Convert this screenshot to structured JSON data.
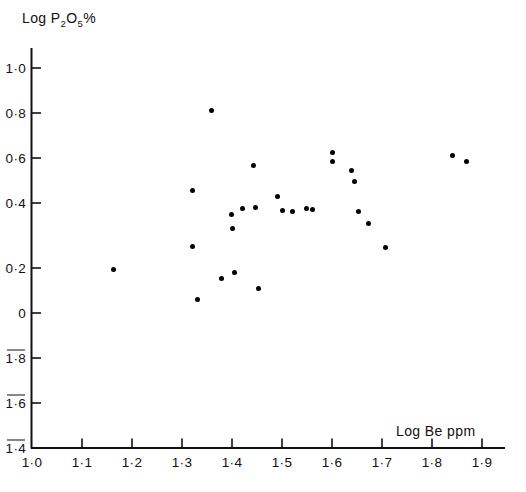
{
  "chart_data": {
    "type": "scatter",
    "title": "",
    "xlabel": "Log  Be ppm",
    "ylabel": "Log P2O5%",
    "ylabel_parts": {
      "prefix": "Log P",
      "sub1": "2",
      "mid": "O",
      "sub2": "5",
      "suffix": "%"
    },
    "xlim": [
      1.0,
      1.95
    ],
    "ylim": [
      -1.4,
      1.05
    ],
    "grid": false,
    "legend": null,
    "xticks": [
      1.0,
      1.1,
      1.2,
      1.3,
      1.4,
      1.5,
      1.6,
      1.7,
      1.8,
      1.9
    ],
    "xtick_labels": [
      "1·0",
      "1·1",
      "1·2",
      "1·3",
      "1·4",
      "1·5",
      "1·6",
      "1·7",
      "1·8",
      "1·9"
    ],
    "yticks": [
      1.0,
      0.8,
      0.6,
      0.4,
      0.2,
      0.0,
      -1.8,
      -1.6,
      -1.4
    ],
    "ytick_labels": [
      "1·0",
      "0·8",
      "0·6",
      "0·4",
      "0·2",
      "0",
      "1·8",
      "1·6",
      "1·4"
    ],
    "ytick_overline": [
      false,
      false,
      false,
      false,
      false,
      false,
      true,
      true,
      true
    ],
    "ytick_overline_note": "Negative values are written with a bar over the leading digit (bar-notation logarithms)",
    "marker": "filled-circle",
    "marker_color": "#000000",
    "marker_size_px": 5,
    "n_points": 33,
    "points": [
      {
        "x": 1.13,
        "y": -1.755
      },
      {
        "x": 1.162,
        "y": 0.195
      },
      {
        "x": 1.32,
        "y": 0.545
      },
      {
        "x": 1.32,
        "y": 0.295
      },
      {
        "x": 1.33,
        "y": 0.06
      },
      {
        "x": 1.358,
        "y": 0.9
      },
      {
        "x": 1.378,
        "y": 0.155
      },
      {
        "x": 1.398,
        "y": 0.44
      },
      {
        "x": 1.4,
        "y": 0.375
      },
      {
        "x": 1.404,
        "y": 0.18
      },
      {
        "x": 1.42,
        "y": 0.465
      },
      {
        "x": 1.442,
        "y": 0.655
      },
      {
        "x": 1.446,
        "y": 0.47
      },
      {
        "x": 1.452,
        "y": 0.11
      },
      {
        "x": 1.49,
        "y": 0.52
      },
      {
        "x": 1.5,
        "y": 0.455
      },
      {
        "x": 1.52,
        "y": 0.45
      },
      {
        "x": 1.548,
        "y": 0.465
      },
      {
        "x": 1.56,
        "y": 0.46
      },
      {
        "x": 1.6,
        "y": 0.715
      },
      {
        "x": 1.6,
        "y": 0.675
      },
      {
        "x": 1.638,
        "y": 0.635
      },
      {
        "x": 1.645,
        "y": 0.585
      },
      {
        "x": 1.652,
        "y": 0.45
      },
      {
        "x": 1.655,
        "y": -1.9
      },
      {
        "x": 1.672,
        "y": 0.4
      },
      {
        "x": 1.706,
        "y": 0.29
      },
      {
        "x": 1.84,
        "y": 0.7
      },
      {
        "x": 1.868,
        "y": 0.675
      }
    ]
  }
}
